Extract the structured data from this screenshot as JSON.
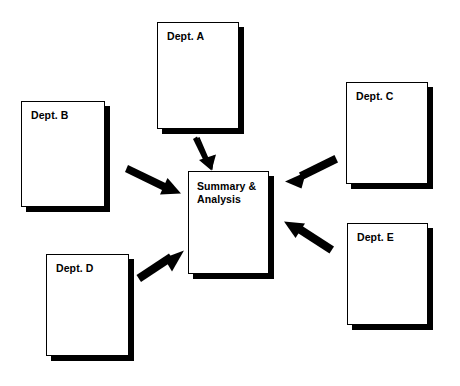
{
  "diagram": {
    "background_color": "#ffffff",
    "ink_color": "#000000",
    "shadow_color": "#000000",
    "nodes": [
      {
        "id": "dept-a",
        "label": "Dept. A",
        "shape": "document-stack",
        "x": 157,
        "y": 22,
        "width": 82,
        "height": 107
      },
      {
        "id": "dept-b",
        "label": "Dept. B",
        "shape": "document-stack",
        "x": 21,
        "y": 101,
        "width": 84,
        "height": 106
      },
      {
        "id": "dept-c",
        "label": "Dept. C",
        "shape": "document-stack",
        "x": 346,
        "y": 82,
        "width": 82,
        "height": 102
      },
      {
        "id": "dept-d",
        "label": "Dept. D",
        "shape": "document-stack",
        "x": 46,
        "y": 254,
        "width": 83,
        "height": 102
      },
      {
        "id": "dept-e",
        "label": "Dept. E",
        "shape": "document-stack",
        "x": 347,
        "y": 223,
        "width": 81,
        "height": 102
      },
      {
        "id": "summary",
        "label": "Summary &\nAnalysis",
        "shape": "document-stack",
        "x": 188,
        "y": 171,
        "width": 81,
        "height": 103
      }
    ],
    "edges": [
      {
        "id": "edge-a-summary",
        "from": "dept-a",
        "to": "summary",
        "direction": "down",
        "x1": 200,
        "y1": 137,
        "x2": 213,
        "y2": 167
      },
      {
        "id": "edge-b-summary",
        "from": "dept-b",
        "to": "summary",
        "direction": "down-right",
        "x1": 128,
        "y1": 166,
        "x2": 180,
        "y2": 193
      },
      {
        "id": "edge-c-summary",
        "from": "dept-c",
        "to": "summary",
        "direction": "down-left",
        "x1": 333,
        "y1": 156,
        "x2": 285,
        "y2": 181
      },
      {
        "id": "edge-d-summary",
        "from": "dept-d",
        "to": "summary",
        "direction": "up-right",
        "x1": 141,
        "y1": 281,
        "x2": 183,
        "y2": 251
      },
      {
        "id": "edge-e-summary",
        "from": "dept-e",
        "to": "summary",
        "direction": "up-left",
        "x1": 329,
        "y1": 252,
        "x2": 284,
        "y2": 222
      }
    ]
  }
}
